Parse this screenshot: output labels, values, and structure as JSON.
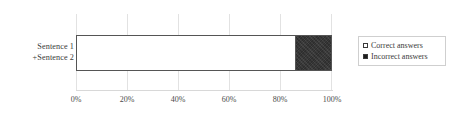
{
  "chart_data": {
    "type": "bar",
    "orientation": "horizontal",
    "stacked": true,
    "title": "",
    "xlabel": "",
    "ylabel": "",
    "categories": [
      "Sentence 1 +Sentence 2"
    ],
    "category_lines": [
      "Sentence 1",
      "+Sentence 2"
    ],
    "series": [
      {
        "name": "Correct answers",
        "values": [
          86
        ],
        "color": "#ffffff"
      },
      {
        "name": "Incorrect answers",
        "values": [
          14
        ],
        "color": "#2e2e2e"
      }
    ],
    "xlim": [
      0,
      100
    ],
    "xticks": [
      0,
      20,
      40,
      60,
      80,
      100
    ],
    "xtick_labels": [
      "0%",
      "20%",
      "40%",
      "60%",
      "80%",
      "100%"
    ],
    "grid": true,
    "grid_axis": "x",
    "legend_position": "right"
  },
  "legend": {
    "items": [
      {
        "label": "Correct answers",
        "marker": "open-square-marker"
      },
      {
        "label": "Incorrect answers",
        "marker": "filled-square-marker"
      }
    ]
  },
  "colors": {
    "correct": "#ffffff",
    "incorrect": "#2e2e2e",
    "bar_border": "#555555",
    "gridline": "#e2e2e2",
    "axis": "#d8d8d8",
    "text": "#3a3a3a"
  }
}
